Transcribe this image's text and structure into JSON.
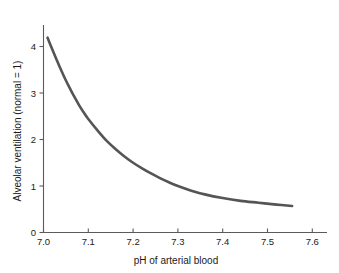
{
  "chart_data": {
    "type": "line",
    "title": "",
    "xlabel": "pH of arterial blood",
    "ylabel": "Alveolar ventilation (normal = 1)",
    "xlim": [
      7.0,
      7.6
    ],
    "ylim": [
      0,
      4.45
    ],
    "grid": false,
    "legend": null,
    "line_color": "#555555",
    "axis_color": "#5b5b5b",
    "background_color": "#ffffff",
    "xticks": [
      7.0,
      7.1,
      7.2,
      7.3,
      7.4,
      7.5,
      7.6
    ],
    "xtick_labels": [
      "7.0",
      "7.1",
      "7.2",
      "7.3",
      "7.4",
      "7.5",
      "7.6"
    ],
    "yticks": [
      0,
      1,
      2,
      3,
      4
    ],
    "ytick_labels": [
      "0",
      "1",
      "2",
      "3",
      "4"
    ],
    "series": [
      {
        "name": "Alveolar ventilation vs pH",
        "x": [
          7.009,
          7.02,
          7.03,
          7.04,
          7.05,
          7.06,
          7.07,
          7.08,
          7.09,
          7.1,
          7.12,
          7.14,
          7.16,
          7.18,
          7.2,
          7.22,
          7.24,
          7.26,
          7.28,
          7.3,
          7.33,
          7.36,
          7.4,
          7.44,
          7.48,
          7.52,
          7.555
        ],
        "y": [
          4.19,
          3.93,
          3.7,
          3.48,
          3.27,
          3.08,
          2.9,
          2.73,
          2.58,
          2.44,
          2.2,
          1.98,
          1.8,
          1.64,
          1.5,
          1.38,
          1.27,
          1.17,
          1.08,
          1.0,
          0.9,
          0.82,
          0.74,
          0.68,
          0.64,
          0.6,
          0.57
        ]
      }
    ]
  },
  "axes": {
    "x_title": "pH of arterial blood",
    "y_title": "Alveolar ventilation (normal = 1)"
  }
}
